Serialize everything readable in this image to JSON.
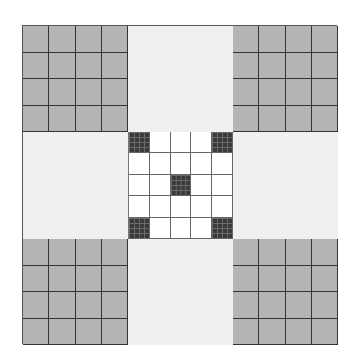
{
  "diagram": {
    "layout": "3x3 block grid",
    "blocks": [
      {
        "position": "top-left",
        "type": "grey-grid",
        "subdivisions": 4,
        "color": "#b4b4b4"
      },
      {
        "position": "top-center",
        "type": "light",
        "color": "#f0f0f0"
      },
      {
        "position": "top-right",
        "type": "grey-grid",
        "subdivisions": 4,
        "color": "#b4b4b4"
      },
      {
        "position": "middle-left",
        "type": "light",
        "color": "#f0f0f0"
      },
      {
        "position": "center",
        "type": "white-grid",
        "subdivisions": 5,
        "dark_cells": [
          [
            0,
            0
          ],
          [
            0,
            4
          ],
          [
            2,
            2
          ],
          [
            4,
            0
          ],
          [
            4,
            4
          ]
        ],
        "dark_cell_subdivisions": 4,
        "dark_color": "#3a3a3a"
      },
      {
        "position": "middle-right",
        "type": "light",
        "color": "#f0f0f0"
      },
      {
        "position": "bottom-left",
        "type": "grey-grid",
        "subdivisions": 4,
        "color": "#b4b4b4"
      },
      {
        "position": "bottom-center",
        "type": "light",
        "color": "#f0f0f0"
      },
      {
        "position": "bottom-right",
        "type": "grey-grid",
        "subdivisions": 4,
        "color": "#b4b4b4"
      }
    ]
  }
}
